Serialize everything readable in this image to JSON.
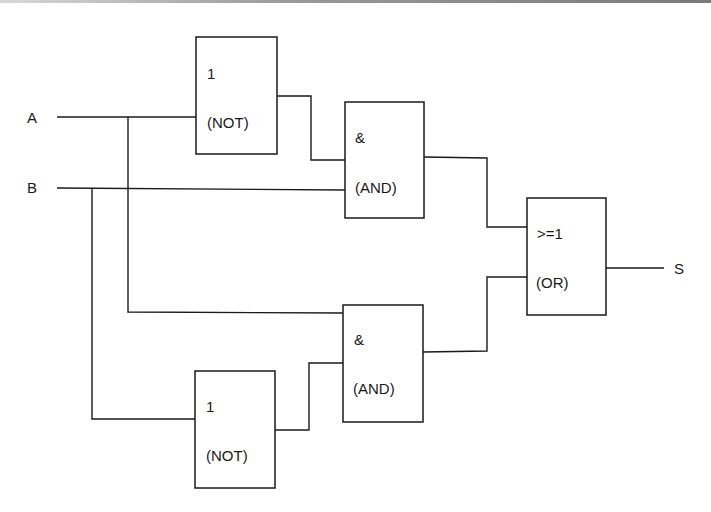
{
  "diagram": {
    "type": "logic-circuit",
    "inputs": [
      {
        "id": "A",
        "label": "A"
      },
      {
        "id": "B",
        "label": "B"
      }
    ],
    "output": {
      "id": "S",
      "label": "S"
    },
    "gates": [
      {
        "id": "not1",
        "symbol": "1",
        "name": "(NOT)"
      },
      {
        "id": "and1",
        "symbol": "&",
        "name": "(AND)"
      },
      {
        "id": "or1",
        "symbol": ">=1",
        "name": "(OR)"
      },
      {
        "id": "and2",
        "symbol": "&",
        "name": "(AND)"
      },
      {
        "id": "not2",
        "symbol": "1",
        "name": "(NOT)"
      }
    ],
    "connections": [
      {
        "from": "A",
        "to": "not1"
      },
      {
        "from": "not1",
        "to": "and1"
      },
      {
        "from": "B",
        "to": "and1"
      },
      {
        "from": "A",
        "to": "and2"
      },
      {
        "from": "B",
        "to": "not2"
      },
      {
        "from": "not2",
        "to": "and2"
      },
      {
        "from": "and1",
        "to": "or1"
      },
      {
        "from": "and2",
        "to": "or1"
      },
      {
        "from": "or1",
        "to": "S"
      }
    ]
  }
}
